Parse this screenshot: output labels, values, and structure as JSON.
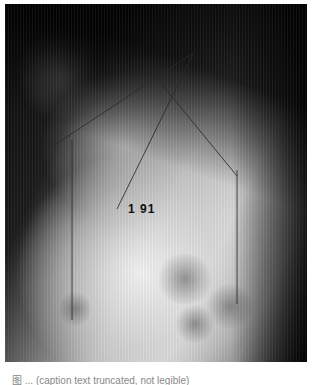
{
  "figure": {
    "type": "lateral radiograph with overlaid measurement lines",
    "annotation_label": "1 91",
    "lines": [
      {
        "x1": 45,
        "y1": 144,
        "x2": 190,
        "y2": 48
      },
      {
        "x1": 150,
        "y1": 72,
        "x2": 232,
        "y2": 172
      },
      {
        "x1": 188,
        "y1": 50,
        "x2": 112,
        "y2": 205
      },
      {
        "x1": 67,
        "y1": 136,
        "x2": 67,
        "y2": 316
      },
      {
        "x1": 232,
        "y1": 166,
        "x2": 232,
        "y2": 300
      }
    ]
  },
  "caption": {
    "text": "图 ... (caption text truncated, not legible)"
  }
}
